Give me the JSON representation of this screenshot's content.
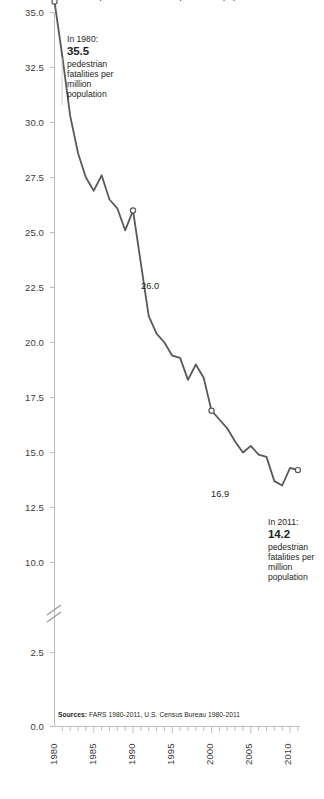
{
  "figure": {
    "title_clipped": "pedestrian fatalities per million population",
    "sources_prefix": "Sources:",
    "sources_text": "FARS 1980-2011, U.S. Census Bureau 1980-2011",
    "line_color": "#58595b",
    "axis_color": "#bcbec0",
    "text_color": "#231f20",
    "background": "#ffffff"
  },
  "axes": {
    "y_ticks": [
      "35.0",
      "32.5",
      "30.0",
      "27.5",
      "25.0",
      "22.5",
      "20.0",
      "17.5",
      "15.0",
      "12.5",
      "10.0",
      "2.5",
      "0.0"
    ],
    "y_break_between": [
      "10.0",
      "2.5"
    ],
    "x_ticks": [
      "1980",
      "1985",
      "1990",
      "1995",
      "2000",
      "2005",
      "2010"
    ],
    "x_minor_every": 1
  },
  "annotations": [
    {
      "name": "callout-1980",
      "lead": "In 1980:",
      "value": "35.5",
      "tail": "pedestrian fatalities per million population"
    },
    {
      "name": "callout-2011",
      "lead": "In 2011:",
      "value": "14.2",
      "tail": "pedestrian fatalities per million population"
    },
    {
      "name": "point-label-1990",
      "text": "26.0"
    },
    {
      "name": "point-label-2000",
      "text": "16.9"
    }
  ],
  "chart_data": {
    "type": "line",
    "title": "pedestrian fatalities per million population",
    "xlabel": "",
    "ylabel": "",
    "xlim": [
      1980,
      2011
    ],
    "ylim": [
      0,
      35
    ],
    "y_axis_break": [
      2.5,
      10.0
    ],
    "grid": false,
    "legend": "none",
    "marker_years": [
      1980,
      1990,
      2000,
      2011
    ],
    "x": [
      1980,
      1981,
      1982,
      1983,
      1984,
      1985,
      1986,
      1987,
      1988,
      1989,
      1990,
      1991,
      1992,
      1993,
      1994,
      1995,
      1996,
      1997,
      1998,
      1999,
      2000,
      2001,
      2002,
      2003,
      2004,
      2005,
      2006,
      2007,
      2008,
      2009,
      2010,
      2011
    ],
    "values": [
      35.5,
      33.0,
      30.3,
      28.6,
      27.5,
      26.9,
      27.6,
      26.5,
      26.1,
      25.1,
      26.0,
      23.6,
      21.2,
      20.4,
      20.0,
      19.4,
      19.3,
      18.3,
      19.0,
      18.4,
      16.9,
      16.5,
      16.1,
      15.5,
      15.0,
      15.3,
      14.9,
      14.8,
      13.7,
      13.5,
      14.3,
      14.2
    ],
    "series_name": "Pedestrian fatalities per million population",
    "annotated_points": [
      {
        "year": 1980,
        "value": 35.5
      },
      {
        "year": 1990,
        "value": 26.0
      },
      {
        "year": 2000,
        "value": 16.9
      },
      {
        "year": 2011,
        "value": 14.2
      }
    ]
  }
}
